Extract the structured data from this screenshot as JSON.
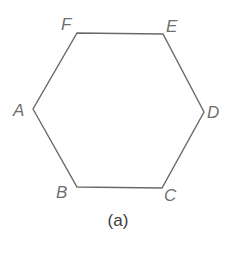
{
  "figure": {
    "caption": "(a)",
    "shape": "hexagon",
    "stroke_color": "#6a6a6a",
    "label_color": "#6f6f6f",
    "vertices": [
      {
        "label": "A",
        "x": 33,
        "y": 109
      },
      {
        "label": "B",
        "x": 77,
        "y": 187
      },
      {
        "label": "C",
        "x": 162,
        "y": 188
      },
      {
        "label": "D",
        "x": 204,
        "y": 112
      },
      {
        "label": "E",
        "x": 163,
        "y": 34
      },
      {
        "label": "F",
        "x": 77,
        "y": 33
      }
    ]
  }
}
